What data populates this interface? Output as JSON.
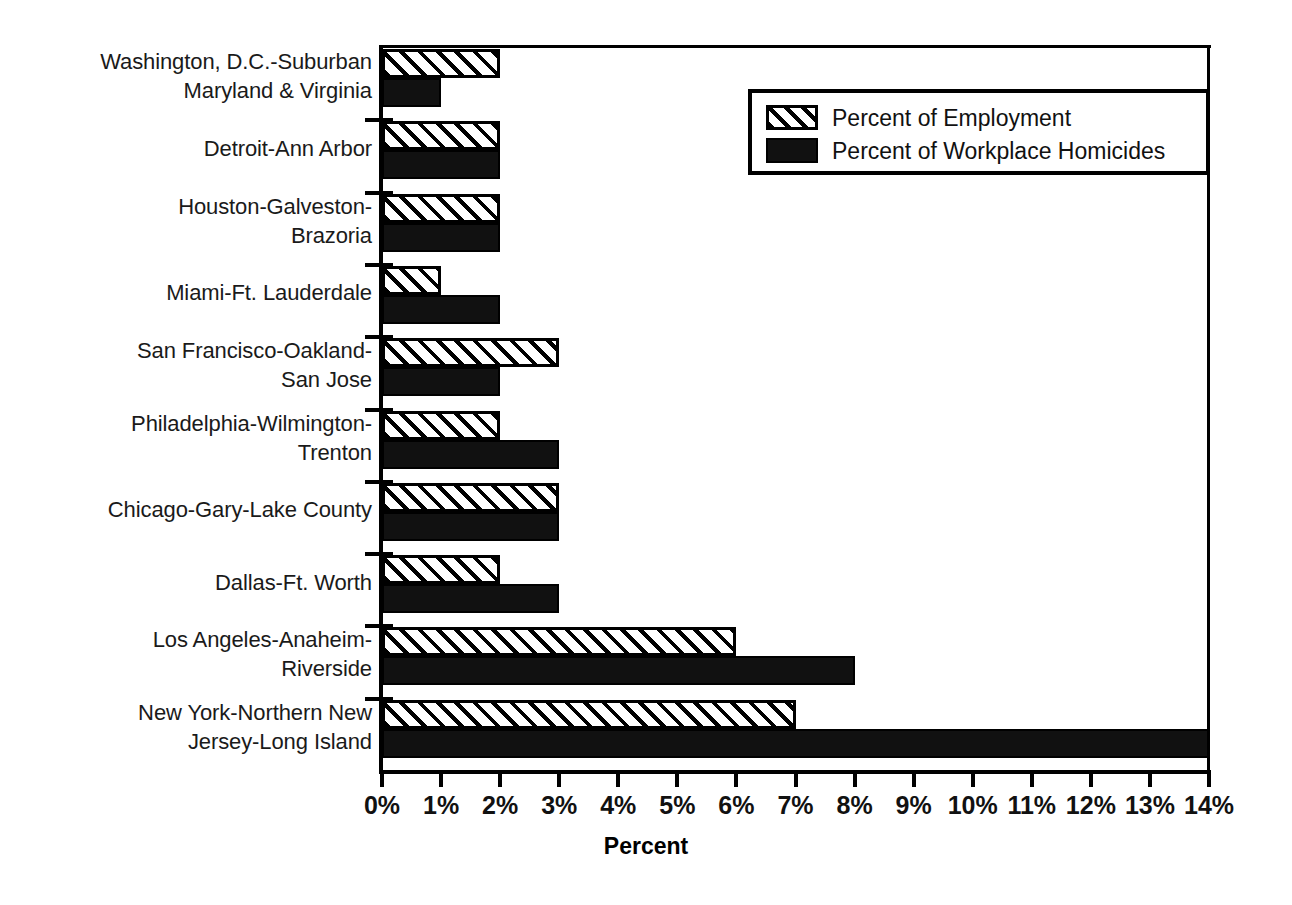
{
  "chart_data": {
    "type": "bar",
    "orientation": "horizontal",
    "title": "",
    "subtitle": "",
    "xlabel": "Percent",
    "ylabel": "",
    "xlim": [
      0,
      14
    ],
    "xtick_labels": [
      "0%",
      "1%",
      "2%",
      "3%",
      "4%",
      "5%",
      "6%",
      "7%",
      "8%",
      "9%",
      "10%",
      "11%",
      "12%",
      "13%",
      "14%"
    ],
    "xtick_values": [
      0,
      1,
      2,
      3,
      4,
      5,
      6,
      7,
      8,
      9,
      10,
      11,
      12,
      13,
      14
    ],
    "grid": false,
    "legend_position": "upper-right-inside",
    "categories": [
      "Washington, D.C.-Suburban\nMaryland & Virginia",
      "Detroit-Ann Arbor",
      "Houston-Galveston-\nBrazoria",
      "Miami-Ft. Lauderdale",
      "San Francisco-Oakland-\nSan Jose",
      "Philadelphia-Wilmington-\nTrenton",
      "Chicago-Gary-Lake County",
      "Dallas-Ft. Worth",
      "Los Angeles-Anaheim-\nRiverside",
      "New York-Northern New\nJersey-Long Island"
    ],
    "series": [
      {
        "name": "Percent of Employment",
        "pattern": "diagonal-hatch",
        "color": "#ffffff",
        "values": [
          2,
          2,
          2,
          1,
          3,
          2,
          3,
          2,
          6,
          7
        ]
      },
      {
        "name": "Percent of Workplace Homicides",
        "pattern": "solid",
        "color": "#111111",
        "values": [
          1,
          2,
          2,
          2,
          2,
          3,
          3,
          3,
          8,
          14
        ]
      }
    ]
  },
  "legend": {
    "items": [
      {
        "label": "Percent of Employment",
        "swatch": "hatch"
      },
      {
        "label": "Percent of Workplace Homicides",
        "swatch": "solid"
      }
    ]
  },
  "axis": {
    "x_title": "Percent"
  }
}
